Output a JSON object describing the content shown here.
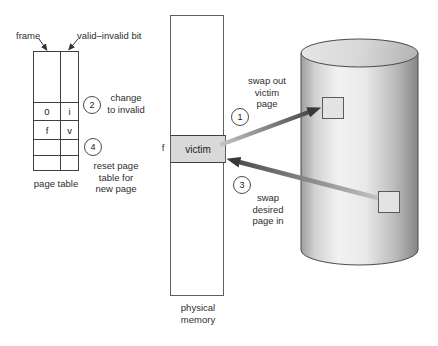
{
  "diagram_name": "page replacement (swap out victim page, swap desired page in)",
  "colors": {
    "background": "#ffffff",
    "line": "#3f3f3f",
    "text": "#2e2e2e",
    "victim_fill": "#d9d9d9",
    "disk_square_fill": "#e3e3e3",
    "arrow_head": "#383838",
    "arrow_shaft_light": "#c4c4c4",
    "cylinder_light": "#f0f0f0",
    "cylinder_dark": "#868686"
  },
  "page_table": {
    "caption": "page table",
    "frame_pointer_label": "frame",
    "valid_invalid_pointer_label": "valid–invalid bit",
    "rows": [
      {
        "frame": "",
        "bit": ""
      },
      {
        "frame": "0",
        "bit": "i"
      },
      {
        "frame": "f",
        "bit": "v"
      },
      {
        "frame": "",
        "bit": ""
      },
      {
        "frame": "",
        "bit": ""
      }
    ]
  },
  "physical_memory": {
    "caption_lines": [
      "physical",
      "memory"
    ],
    "frame_label": "f",
    "victim_label": "victim"
  },
  "steps": {
    "step1": {
      "number": "1",
      "lines": [
        "swap out",
        "victim",
        "page"
      ]
    },
    "step2": {
      "number": "2",
      "lines": [
        "change",
        "to invalid"
      ]
    },
    "step3": {
      "number": "3",
      "lines": [
        "swap",
        "desired",
        "page in"
      ]
    },
    "step4": {
      "number": "4",
      "lines": [
        "reset page",
        "table for",
        "new page"
      ]
    }
  }
}
